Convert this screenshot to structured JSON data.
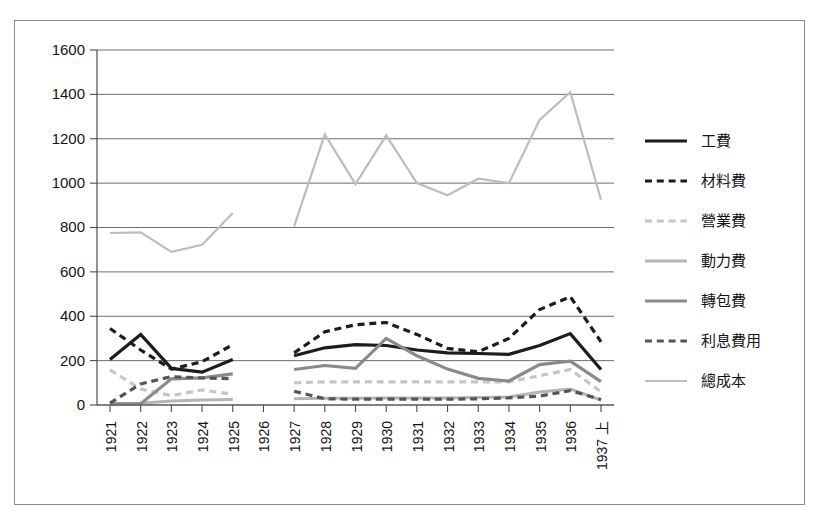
{
  "chart_data": {
    "type": "line",
    "title": "",
    "xlabel": "",
    "ylabel": "",
    "ylim": [
      0,
      1600
    ],
    "ytick_values": [
      0,
      200,
      400,
      600,
      800,
      1000,
      1200,
      1400,
      1600
    ],
    "ytick_labels": [
      "0",
      "200",
      "400",
      "600",
      "800",
      "1000",
      "1200",
      "1400",
      "1600"
    ],
    "grid": true,
    "legend_position": "right",
    "categories": [
      "1921",
      "1922",
      "1923",
      "1924",
      "1925",
      "1926",
      "1927",
      "1928",
      "1929",
      "1930",
      "1931",
      "1932",
      "1933",
      "1934",
      "1935",
      "1936",
      "1937 上"
    ],
    "series": [
      {
        "name": "工費",
        "color": "#1c1c1c",
        "style": "solid",
        "width": 3.2,
        "values": [
          205,
          318,
          165,
          148,
          205,
          null,
          222,
          258,
          272,
          268,
          248,
          235,
          232,
          228,
          268,
          322,
          160
        ]
      },
      {
        "name": "材料費",
        "color": "#1c1c1c",
        "style": "dashed",
        "width": 3.2,
        "values": [
          345,
          248,
          162,
          195,
          272,
          null,
          235,
          330,
          362,
          372,
          318,
          255,
          240,
          300,
          430,
          488,
          285
        ]
      },
      {
        "name": "營業費",
        "color": "#c6c6c6",
        "style": "dashed",
        "width": 3.2,
        "values": [
          158,
          72,
          42,
          68,
          48,
          null,
          100,
          104,
          104,
          104,
          104,
          104,
          104,
          104,
          132,
          160,
          60
        ]
      },
      {
        "name": "動力費",
        "color": "#b4b4b4",
        "style": "solid",
        "width": 3.0,
        "values": [
          5,
          8,
          18,
          22,
          25,
          null,
          28,
          30,
          30,
          32,
          32,
          32,
          34,
          36,
          58,
          72,
          22
        ]
      },
      {
        "name": "轉包費",
        "color": "#8a8a8a",
        "style": "solid",
        "width": 3.2,
        "values": [
          5,
          6,
          118,
          122,
          140,
          null,
          160,
          178,
          165,
          300,
          222,
          162,
          120,
          108,
          182,
          198,
          105
        ]
      },
      {
        "name": "利息費用",
        "color": "#555555",
        "style": "dashed",
        "width": 3.2,
        "values": [
          8,
          95,
          128,
          122,
          118,
          null,
          62,
          28,
          26,
          26,
          26,
          26,
          28,
          32,
          40,
          65,
          25
        ]
      },
      {
        "name": "總成本",
        "color": "#bdbdbd",
        "style": "solid",
        "width": 2.2,
        "values": [
          775,
          778,
          690,
          722,
          865,
          null,
          805,
          1220,
          995,
          1215,
          1000,
          945,
          1020,
          1000,
          1285,
          1410,
          925
        ]
      }
    ]
  }
}
